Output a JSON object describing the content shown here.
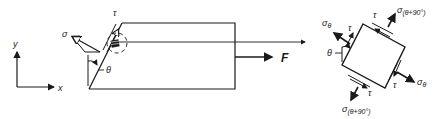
{
  "diagram": {
    "type": "stress-element-diagram",
    "colors": {
      "ink": "#1a1a1a",
      "background": "#ffffff"
    },
    "axes": {
      "x_label": "x",
      "y_label": "y"
    },
    "bar": {
      "force_label": "F",
      "normal_stress_label": "σ",
      "shear_stress_label": "τ",
      "angle_label": "θ"
    },
    "element": {
      "sigma_theta": "σθ",
      "sigma_theta_sub": "θ",
      "sigma_main": "σ",
      "sigma_90_sub": "(θ+90°)",
      "tau": "τ",
      "angle": "θ"
    }
  }
}
